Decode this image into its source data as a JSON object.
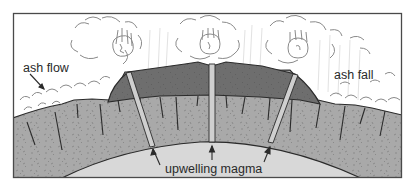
{
  "diagram": {
    "type": "geologic cross-section",
    "labels": {
      "ash_flow": "ash flow",
      "ash_fall": "ash fall",
      "upwelling_magma": "upwelling magma"
    },
    "colors": {
      "background": "#ffffff",
      "frame": "#4a4a4a",
      "magma": "#d8d8d8",
      "crust": "#a9a9a9",
      "cap_rock": "#6e6e6e",
      "conduit": "#cfcfcf",
      "outline": "#2b2b2b",
      "cloud_line": "#8a8a8a"
    }
  }
}
